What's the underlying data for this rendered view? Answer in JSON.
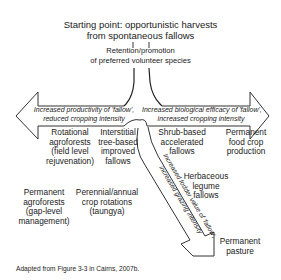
{
  "diagram": {
    "title_line1": "Starting point: opportunistic harvests",
    "title_line2": "from spontaneous fallows",
    "retention_line1": "Retention/promotion",
    "retention_line2": "of preferred volunteer species",
    "left_arrow": {
      "line1": "Increased productivity of 'fallow',",
      "line2": "reduced cropping intensity"
    },
    "right_arrow": {
      "line1": "Increased biological efficacy of 'fallow',",
      "line2": "increased cropping intensity"
    },
    "diagonal_arrow": {
      "line1": "Increased fodder value of 'fallow',",
      "line2": "increased grazing intensity"
    },
    "nodes": {
      "rotational": [
        "Rotational",
        "agroforests",
        "(field level",
        "rejuvenation)"
      ],
      "interstitial": [
        "Interstitial",
        "tree-based",
        "improved",
        "fallows"
      ],
      "permanent_agroforests": [
        "Permanent",
        "agroforests",
        "(gap-level",
        "management)"
      ],
      "perennial": [
        "Perennial/annual",
        "crop rotations",
        "(taungya)"
      ],
      "shrub": [
        "Shrub-based",
        "accelerated",
        "fallows"
      ],
      "permanent_food": [
        "Permanent",
        "food crop",
        "production"
      ],
      "herbaceous": [
        "Herbaceous",
        "legume",
        "fallows"
      ],
      "pasture": [
        "Permanent",
        "pasture"
      ]
    },
    "caption": "Adapted from Figure 3-3 in Cairns, 2007b."
  }
}
